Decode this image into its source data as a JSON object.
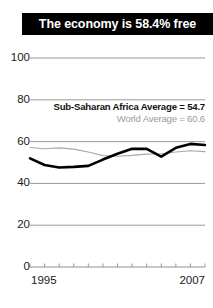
{
  "title": {
    "text": "The economy is 58.4% free"
  },
  "legend": {
    "africa": "Sub-Saharan Africa Average = 54.7",
    "world": "World Average = 60.6"
  },
  "axis": {
    "x_start_label": "1995",
    "x_end_label": "2007",
    "y_labels": [
      "100",
      "80",
      "60",
      "40",
      "20",
      "0"
    ]
  },
  "colors": {
    "banner_bg": "#000000",
    "banner_text": "#ffffff",
    "series_country": "#000000",
    "series_world": "#a8a8a8",
    "gridline": "#8f8f8f",
    "axis_text": "#1a1a1a",
    "legend_world_text": "#9a9a9a"
  },
  "chart_data": {
    "type": "line",
    "title": "The economy is 58.4% free",
    "xlabel": "",
    "ylabel": "",
    "xlim": [
      1995,
      2007
    ],
    "ylim": [
      0,
      100
    ],
    "yticks": [
      0,
      20,
      40,
      60,
      80,
      100
    ],
    "xticks": [
      1995,
      1996,
      1997,
      1998,
      1999,
      2000,
      2001,
      2002,
      2003,
      2004,
      2005,
      2006,
      2007
    ],
    "xtick_labels_shown": [
      "1995",
      "2007"
    ],
    "grid": true,
    "legend_position": "upper-right-inside",
    "x": [
      1995,
      1996,
      1997,
      1998,
      1999,
      2000,
      2001,
      2002,
      2003,
      2004,
      2005,
      2006,
      2007
    ],
    "series": [
      {
        "name": "Country economic freedom",
        "color": "#000000",
        "linewidth": 2.6,
        "values": [
          52.0,
          48.8,
          47.6,
          47.9,
          48.4,
          51.4,
          54.2,
          56.6,
          56.5,
          52.8,
          57.0,
          58.9,
          58.4
        ]
      },
      {
        "name": "World Average",
        "color": "#a8a8a8",
        "linewidth": 1.1,
        "values": [
          57.2,
          56.6,
          57.0,
          56.4,
          55.0,
          53.3,
          53.0,
          53.4,
          54.0,
          54.2,
          55.0,
          55.6,
          55.2
        ]
      }
    ],
    "annotations": [
      {
        "text": "Sub-Saharan Africa Average = 54.7",
        "value": 54.7,
        "style": "bold-dark"
      },
      {
        "text": "World Average = 60.6",
        "value": 60.6,
        "style": "gray"
      }
    ]
  }
}
